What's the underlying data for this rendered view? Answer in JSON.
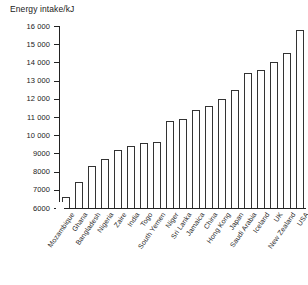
{
  "chart_data": {
    "type": "bar",
    "title": "Energy intake/kJ",
    "xlabel": "",
    "ylabel": "Energy intake/kJ",
    "ylim": [
      6000,
      16000
    ],
    "grid": false,
    "legend": null,
    "y_ticks": [
      6000,
      7000,
      8000,
      9000,
      10000,
      11000,
      12000,
      13000,
      14000,
      15000,
      16000
    ],
    "y_tick_labels": [
      "6000",
      "7000",
      "8000",
      "9000",
      "10 000",
      "11 000",
      "12 000",
      "13 000",
      "14 000",
      "15 000",
      "16 000"
    ],
    "axis_break": true,
    "categories": [
      "Mozambique",
      "Ghana",
      "Bangladesh",
      "Nigeria",
      "Zaire",
      "India",
      "Togo",
      "South Yemen",
      "Niger",
      "Sri Lanka",
      "Jamaica",
      "China",
      "Hong Kong",
      "Japan",
      "Saudi Arabia",
      "Iceland",
      "UK",
      "New Zealand",
      "USA"
    ],
    "values": [
      6600,
      7450,
      8300,
      8700,
      9200,
      9400,
      9550,
      9600,
      10800,
      10900,
      11400,
      11600,
      12000,
      12500,
      13400,
      13600,
      14000,
      14500,
      15800
    ]
  }
}
